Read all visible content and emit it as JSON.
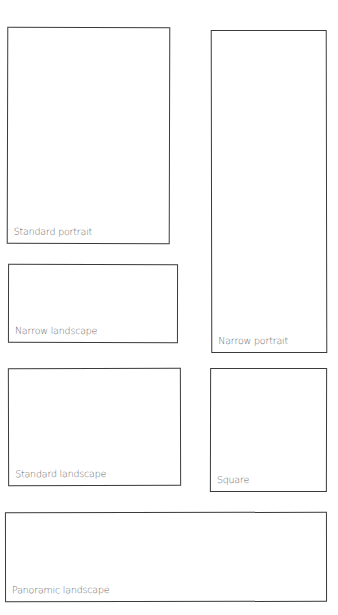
{
  "diagram": {
    "stroke_color": "#3a3a3a",
    "label_color": "#6b6b6b",
    "frames": [
      {
        "id": "standard-portrait",
        "label": "Standard portrait"
      },
      {
        "id": "narrow-portrait",
        "label": "Narrow portrait"
      },
      {
        "id": "narrow-landscape",
        "label": "Narrow landscape"
      },
      {
        "id": "standard-landscape",
        "label": "Standard landscape"
      },
      {
        "id": "square",
        "label": "Square"
      },
      {
        "id": "panoramic-landscape",
        "label": "Panoramic landscape"
      }
    ]
  }
}
